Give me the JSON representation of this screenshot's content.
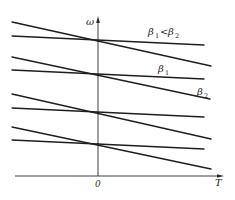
{
  "diagram": {
    "axes": {
      "y_label": "ω",
      "x_label": "T",
      "origin_label": "0",
      "origin_x": 98,
      "x_axis_y": 176,
      "x_axis_start": 15,
      "x_axis_end": 223,
      "y_axis_top": 18
    },
    "labels": {
      "comparison": {
        "beta": "β",
        "sub1": "1",
        "op": "<",
        "sub2": "2"
      },
      "beta1": {
        "beta": "β",
        "sub": "1"
      },
      "beta2": {
        "beta": "β",
        "sub": "2"
      }
    },
    "line_pairs": [
      {
        "intersect_y": 41,
        "shallow": {
          "x1": 12,
          "y1": 36,
          "x2": 204,
          "y2": 45
        },
        "steep": {
          "x1": 12,
          "y1": 22,
          "x2": 211,
          "y2": 66
        }
      },
      {
        "intersect_y": 75,
        "shallow": {
          "x1": 12,
          "y1": 70,
          "x2": 204,
          "y2": 79
        },
        "steep": {
          "x1": 12,
          "y1": 57,
          "x2": 210,
          "y2": 99
        }
      },
      {
        "intersect_y": 113,
        "shallow": {
          "x1": 12,
          "y1": 108,
          "x2": 204,
          "y2": 117
        },
        "steep": {
          "x1": 12,
          "y1": 94,
          "x2": 211,
          "y2": 139
        }
      },
      {
        "intersect_y": 144,
        "shallow": {
          "x1": 12,
          "y1": 140,
          "x2": 204,
          "y2": 149
        },
        "steep": {
          "x1": 12,
          "y1": 127,
          "x2": 211,
          "y2": 169
        }
      }
    ],
    "colors": {
      "line": "#1e1e1e",
      "axis": "#2a2a2a",
      "background": "#ffffff"
    }
  }
}
